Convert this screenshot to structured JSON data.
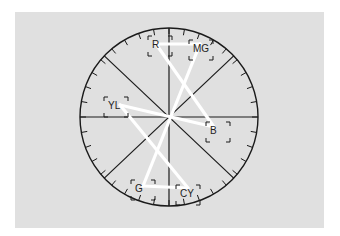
{
  "scope": {
    "type": "vectorscope",
    "colors": {
      "background": "#e0e0e0",
      "graticule": "#1a1a1a",
      "trace": "#ffffff"
    },
    "targets": [
      {
        "id": "R",
        "label": "R"
      },
      {
        "id": "MG",
        "label": "MG"
      },
      {
        "id": "B",
        "label": "B"
      },
      {
        "id": "CY",
        "label": "CY"
      },
      {
        "id": "G",
        "label": "G"
      },
      {
        "id": "YL",
        "label": "YL"
      }
    ],
    "trace_path": [
      "R",
      "MG",
      "G",
      "CY",
      "YL",
      "B",
      "R"
    ]
  }
}
